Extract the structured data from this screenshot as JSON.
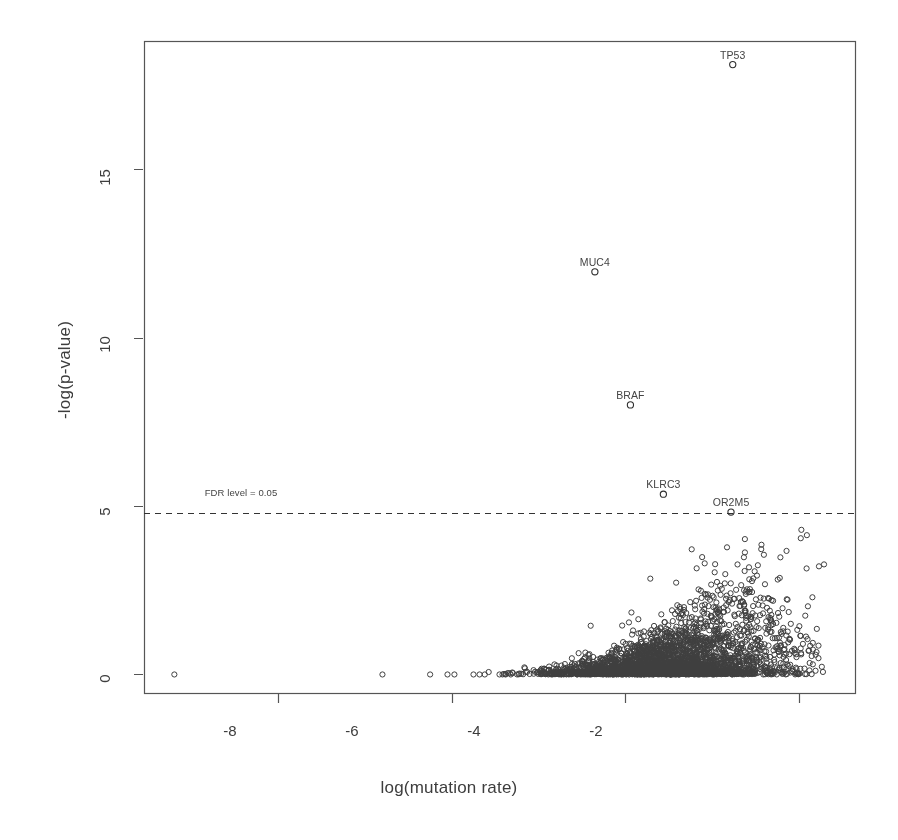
{
  "chart_data": {
    "type": "scatter",
    "title": "",
    "xlabel": "log(mutation rate)",
    "ylabel": "-log(p-value)",
    "xlim": [
      -9.55,
      -1.35
    ],
    "ylim": [
      -0.55,
      18.8
    ],
    "xticks": [
      -8,
      -6,
      -4,
      -2
    ],
    "xtick_labels": [
      "-8",
      "-6",
      "-4",
      "-2"
    ],
    "yticks": [
      0,
      5,
      10,
      15
    ],
    "ytick_labels": [
      "0",
      "5",
      "10",
      "15"
    ],
    "grid": false,
    "legend": false,
    "point_style": "open-circle",
    "point_color": "#3f3f3f",
    "point_radius_px": 2.6,
    "threshold_line": {
      "label": "FDR level = 0.05",
      "y": 4.78,
      "style": "dashed",
      "color": "#333333",
      "label_x": -8.85,
      "label_y": 5.35
    },
    "labeled_points": [
      {
        "gene": "TP53",
        "x": -2.76,
        "y": 18.1
      },
      {
        "gene": "MUC4",
        "x": -4.35,
        "y": 11.95
      },
      {
        "gene": "BRAF",
        "x": -3.94,
        "y": 8.0
      },
      {
        "gene": "KLRC3",
        "x": -3.56,
        "y": 5.35
      },
      {
        "gene": "OR2M5",
        "x": -2.78,
        "y": 4.82
      }
    ],
    "outlier_points": [
      {
        "x": -9.2,
        "y": 0.0
      },
      {
        "x": -6.8,
        "y": 0.0
      },
      {
        "x": -6.25,
        "y": 0.0
      },
      {
        "x": -6.05,
        "y": 0.0
      },
      {
        "x": -5.97,
        "y": 0.0
      },
      {
        "x": -5.75,
        "y": 0.0
      },
      {
        "x": -5.68,
        "y": 0.0
      },
      {
        "x": -5.62,
        "y": 0.0
      },
      {
        "x": -5.45,
        "y": 0.0
      },
      {
        "x": -5.38,
        "y": 0.0
      },
      {
        "x": -5.32,
        "y": 0.0
      }
    ],
    "cloud_description": {
      "n_points": 2600,
      "x_range": [
        -5.6,
        -1.7
      ],
      "x_mode": -3.6,
      "y_floor": 0.0,
      "y_max_typical": 4.3,
      "shape": "dense wedge rising from lower-left baseline toward upper-right; density peaks near x=-3.6 and y=0.3; sparse scatter up to y~4.3 on the right side"
    }
  },
  "axes": {
    "box_left_px": 144,
    "box_top_px": 41,
    "box_right_px": 855,
    "box_bottom_px": 693
  }
}
